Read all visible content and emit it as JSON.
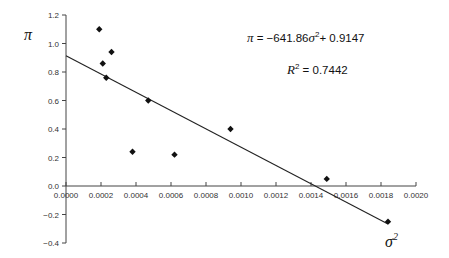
{
  "chart_data": {
    "type": "scatter",
    "title": "",
    "xlabel": "σ²",
    "ylabel": "π",
    "xlim": [
      0.0,
      0.002
    ],
    "ylim": [
      -0.4,
      1.2
    ],
    "x_ticks": [
      "0.0000",
      "0.0002",
      "0.0004",
      "0.0006",
      "0.0008",
      "0.0010",
      "0.0012",
      "0.0014",
      "0.0016",
      "0.0018",
      "0.0020"
    ],
    "y_ticks": [
      "1.2",
      "1.0",
      "0.8",
      "0.6",
      "0.4",
      "0.2",
      "0.0",
      "−0.2",
      "−0.4"
    ],
    "grid": false,
    "legend": null,
    "series": [
      {
        "name": "observations",
        "marker": "diamond",
        "points": [
          {
            "x": 0.00019,
            "y": 1.1
          },
          {
            "x": 0.00021,
            "y": 0.86
          },
          {
            "x": 0.00026,
            "y": 0.94
          },
          {
            "x": 0.00023,
            "y": 0.76
          },
          {
            "x": 0.00047,
            "y": 0.6
          },
          {
            "x": 0.00038,
            "y": 0.24
          },
          {
            "x": 0.00062,
            "y": 0.22
          },
          {
            "x": 0.00094,
            "y": 0.4
          },
          {
            "x": 0.00149,
            "y": 0.05
          },
          {
            "x": 0.00184,
            "y": -0.25
          }
        ]
      }
    ],
    "trendline": {
      "type": "linear",
      "slope": -641.86,
      "intercept": 0.9147,
      "r_squared": 0.7442,
      "x_range": [
        0.0,
        0.00184
      ]
    },
    "annotations": {
      "equation": {
        "lhs": "π",
        "eq": " = −641.86",
        "var": "σ",
        "sup": "2",
        "rest": "+ 0.9147"
      },
      "r2": {
        "var": "R",
        "sup": "2",
        "rest": " = 0.7442"
      }
    }
  }
}
